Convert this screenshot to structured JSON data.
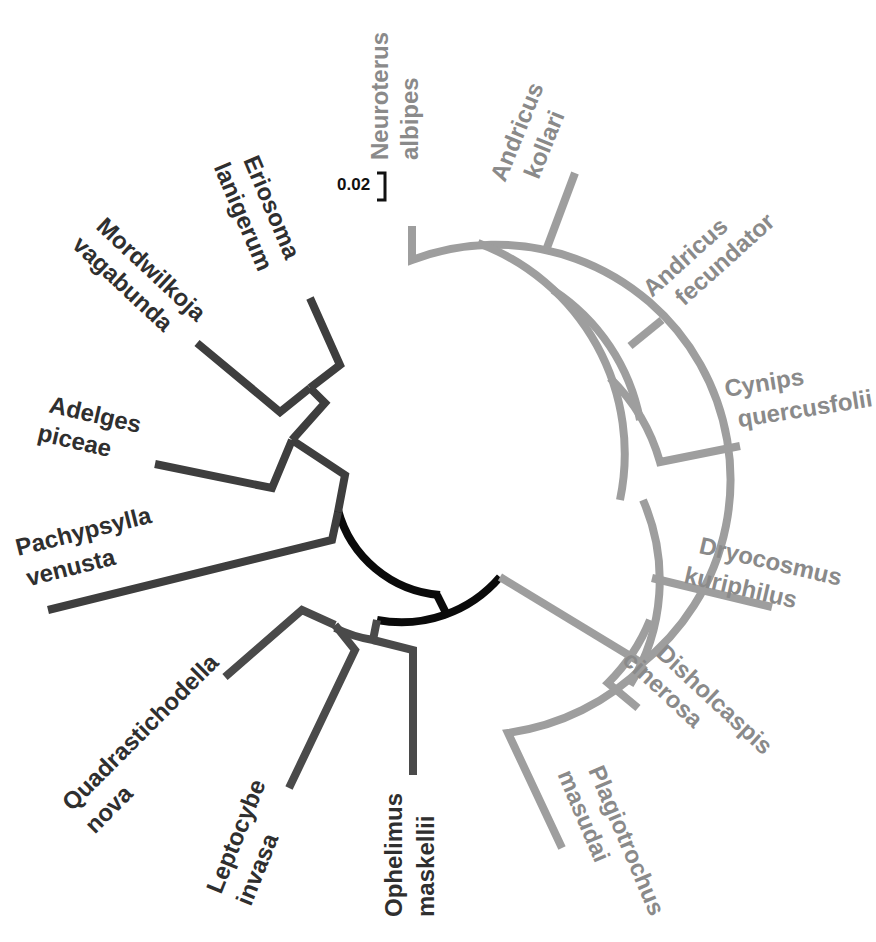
{
  "figure": {
    "type": "circular-phylogenetic-tree",
    "scale_bar": {
      "label": "0.02"
    },
    "colors": {
      "cynipid_clade": "#9e9e9e",
      "hemipteran_clade": "#3e3e3e",
      "chalcid_clade": "#4a4a4a",
      "root_arc": "#0a0a0a"
    }
  },
  "taxa": [
    {
      "genus": "Neuroterus",
      "species": "albipes",
      "clade": "cynipid"
    },
    {
      "genus": "Andricus",
      "species": "kollari",
      "clade": "cynipid"
    },
    {
      "genus": "Andricus",
      "species": "fecundator",
      "clade": "cynipid"
    },
    {
      "genus": "Cynips",
      "species": "quercusfolii",
      "clade": "cynipid"
    },
    {
      "genus": "Dryocosmus",
      "species": "kuriphilus",
      "clade": "cynipid"
    },
    {
      "genus": "Disholcaspis",
      "species": "cinerosa",
      "clade": "cynipid"
    },
    {
      "genus": "Plagiotrochus",
      "species": "masudai",
      "clade": "cynipid"
    },
    {
      "genus": "Ophelimus",
      "species": "maskellii",
      "clade": "chalcid"
    },
    {
      "genus": "Leptocybe",
      "species": "invasa",
      "clade": "chalcid"
    },
    {
      "genus": "Quadrastichodella",
      "species": "nova",
      "clade": "chalcid"
    },
    {
      "genus": "Pachypsylla",
      "species": "venusta",
      "clade": "hemipteran"
    },
    {
      "genus": "Adelges",
      "species": "piceae",
      "clade": "hemipteran"
    },
    {
      "genus": "Mordwilkoja",
      "species": "vagabunda",
      "clade": "hemipteran"
    },
    {
      "genus": "Eriosoma",
      "species": "lanigerum",
      "clade": "hemipteran"
    }
  ]
}
